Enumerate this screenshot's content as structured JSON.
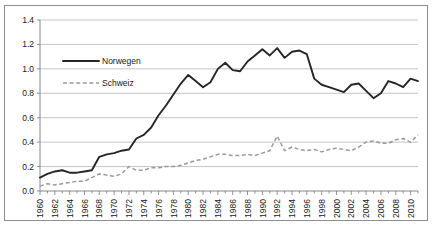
{
  "chart_data": {
    "type": "line",
    "title": "",
    "xlabel": "",
    "ylabel": "",
    "ylim": [
      0.0,
      1.4
    ],
    "xlim": [
      1960,
      2011
    ],
    "grid": true,
    "legend_position": "inside-top-left",
    "ytick_labels": [
      "1.4",
      "1.2",
      "1.0",
      "0.8",
      "0.6",
      "0.4",
      "0.2",
      "0.0"
    ],
    "ytick_values": [
      1.4,
      1.2,
      1.0,
      0.8,
      0.6,
      0.4,
      0.2,
      0.0
    ],
    "xtick_labels": [
      "1960",
      "1962",
      "1964",
      "1966",
      "1968",
      "1970",
      "1972",
      "1974",
      "1976",
      "1978",
      "1980",
      "1982",
      "1984",
      "1986",
      "1988",
      "1990",
      "1992",
      "1994",
      "1996",
      "1998",
      "2000",
      "2002",
      "2004",
      "2006",
      "2008",
      "2010"
    ],
    "xtick_values": [
      1960,
      1962,
      1964,
      1966,
      1968,
      1970,
      1972,
      1974,
      1976,
      1978,
      1980,
      1982,
      1984,
      1986,
      1988,
      1990,
      1992,
      1994,
      1996,
      1998,
      2000,
      2002,
      2004,
      2006,
      2008,
      2010
    ],
    "x": [
      1960,
      1961,
      1962,
      1963,
      1964,
      1965,
      1966,
      1967,
      1968,
      1969,
      1970,
      1971,
      1972,
      1973,
      1974,
      1975,
      1976,
      1977,
      1978,
      1979,
      1980,
      1981,
      1982,
      1983,
      1984,
      1985,
      1986,
      1987,
      1988,
      1989,
      1990,
      1991,
      1992,
      1993,
      1994,
      1995,
      1996,
      1997,
      1998,
      1999,
      2000,
      2001,
      2002,
      2003,
      2004,
      2005,
      2006,
      2007,
      2008,
      2009,
      2010,
      2011
    ],
    "series": [
      {
        "name": "Norwegen",
        "style": "solid",
        "color": "#262626",
        "values": [
          0.11,
          0.14,
          0.16,
          0.17,
          0.15,
          0.15,
          0.16,
          0.17,
          0.28,
          0.3,
          0.31,
          0.33,
          0.34,
          0.43,
          0.46,
          0.52,
          0.62,
          0.7,
          0.79,
          0.88,
          0.95,
          0.9,
          0.85,
          0.89,
          1.0,
          1.05,
          0.99,
          0.98,
          1.06,
          1.11,
          1.16,
          1.11,
          1.17,
          1.09,
          1.14,
          1.15,
          1.12,
          0.92,
          0.87,
          0.85,
          0.83,
          0.81,
          0.87,
          0.88,
          0.82,
          0.76,
          0.8,
          0.9,
          0.88,
          0.85,
          0.92,
          0.9
        ]
      },
      {
        "name": "Schweiz",
        "style": "dashed",
        "color": "#9a9a9a",
        "values": [
          0.04,
          0.06,
          0.05,
          0.06,
          0.07,
          0.08,
          0.08,
          0.11,
          0.14,
          0.13,
          0.12,
          0.14,
          0.2,
          0.17,
          0.17,
          0.19,
          0.19,
          0.2,
          0.2,
          0.21,
          0.23,
          0.25,
          0.26,
          0.28,
          0.3,
          0.3,
          0.29,
          0.29,
          0.3,
          0.29,
          0.31,
          0.33,
          0.45,
          0.33,
          0.36,
          0.34,
          0.33,
          0.34,
          0.32,
          0.34,
          0.35,
          0.34,
          0.33,
          0.36,
          0.4,
          0.41,
          0.39,
          0.39,
          0.42,
          0.43,
          0.4,
          0.46
        ]
      }
    ]
  },
  "legend": {
    "entries": [
      {
        "label": "Norwegen",
        "style": "solid"
      },
      {
        "label": "Schweiz",
        "style": "dashed"
      }
    ]
  }
}
